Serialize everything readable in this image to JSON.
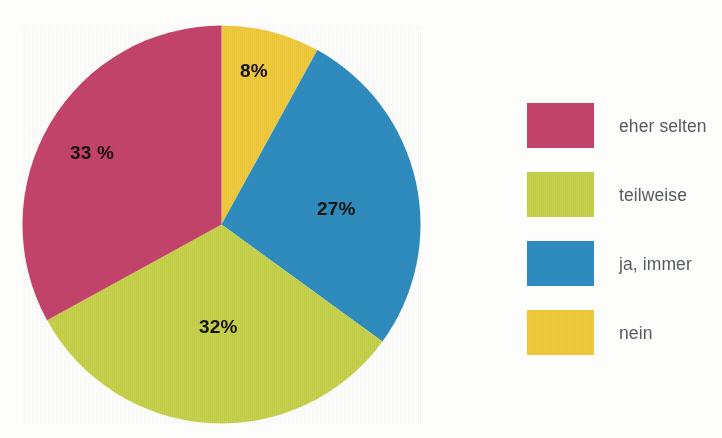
{
  "figure": {
    "cropped_headline_text": "",
    "background_color": "#fdfdfb"
  },
  "chart_data": {
    "type": "pie",
    "title": "",
    "xlabel": "",
    "ylabel": "",
    "legend_position": "right",
    "grid": false,
    "start_angle_deg": 0,
    "direction": "clockwise",
    "units": "percent",
    "total": 100,
    "categories": [
      "nein",
      "ja, immer",
      "teilweise",
      "eher selten"
    ],
    "values": [
      8,
      27,
      32,
      33
    ],
    "colors": [
      "#EFC93C",
      "#2E8CBE",
      "#C5D14A",
      "#C4436B"
    ],
    "slices": [
      {
        "label": "nein",
        "value": 8,
        "value_text": "8%",
        "color": "#EFC93C",
        "start_deg": 0,
        "end_deg": 28.8,
        "label_x": 240,
        "label_y": 60
      },
      {
        "label": "ja, immer",
        "value": 27,
        "value_text": "27%",
        "color": "#2E8CBE",
        "start_deg": 28.8,
        "end_deg": 126,
        "label_x": 317,
        "label_y": 198
      },
      {
        "label": "teilweise",
        "value": 32,
        "value_text": "32%",
        "color": "#C5D14A",
        "start_deg": 126,
        "end_deg": 241.2,
        "label_x": 199,
        "label_y": 316
      },
      {
        "label": "eher selten",
        "value": 33,
        "value_text": "33 %",
        "color": "#C4436B",
        "start_deg": 241.2,
        "end_deg": 360,
        "label_x": 70,
        "label_y": 142
      }
    ]
  },
  "legend": {
    "items": [
      {
        "label": "eher selten",
        "color": "#C4436B"
      },
      {
        "label": "teilweise",
        "color": "#C5D14A"
      },
      {
        "label": "ja, immer",
        "color": "#2E8CBE"
      },
      {
        "label": "nein",
        "color": "#EFC93C"
      }
    ]
  }
}
